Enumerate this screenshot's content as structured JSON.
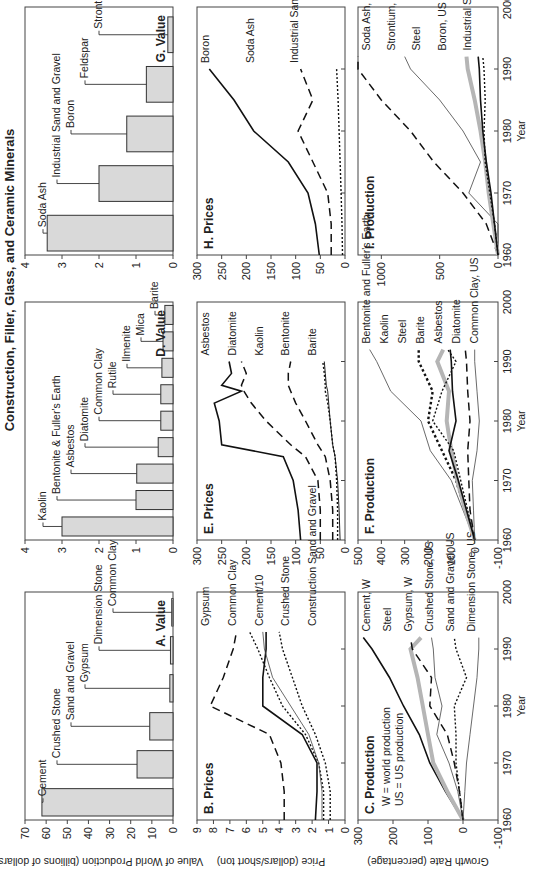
{
  "figure_title": "Construction, Filler, Glass, and Ceramic Minerals",
  "chart_data": [
    {
      "id": "A",
      "type": "bar",
      "title": "A. Value",
      "ylabel": "Value of World Production (billions of dollars)",
      "ylim": [
        0,
        70
      ],
      "yticks": [
        0,
        10,
        20,
        30,
        40,
        50,
        60,
        70
      ],
      "categories": [
        "Cement",
        "Crushed Stone",
        "Sand and Gravel",
        "Gypsum",
        "Dimension Stone",
        "Common Clay"
      ],
      "values": [
        62,
        17,
        11,
        1.5,
        1.2,
        0.6
      ]
    },
    {
      "id": "D",
      "type": "bar",
      "title": "D. Value",
      "ylim": [
        0,
        4
      ],
      "yticks": [
        0,
        1,
        2,
        3,
        4
      ],
      "categories": [
        "Kaolin",
        "Bentonite & Fuller's Earth",
        "Asbestos",
        "Diatomite",
        "Common Clay",
        "Rutile",
        "Ilmenite",
        "Mica",
        "Barite"
      ],
      "values": [
        3.0,
        1.0,
        0.98,
        0.4,
        0.33,
        0.33,
        0.3,
        0.27,
        0.22
      ]
    },
    {
      "id": "G",
      "type": "bar",
      "title": "G. Value",
      "ylim": [
        0,
        4
      ],
      "yticks": [
        0,
        1,
        2,
        3,
        4
      ],
      "categories": [
        "Soda Ash",
        "Industrial Sand and Gravel",
        "Boron",
        "Feldspar",
        "Strontium"
      ],
      "values": [
        3.4,
        2.0,
        1.25,
        0.72,
        0.14
      ]
    },
    {
      "id": "B",
      "type": "line",
      "title": "B. Prices",
      "ylabel": "Price (dollars/short ton)",
      "ylim": [
        0,
        9
      ],
      "yticks": [
        0,
        1,
        2,
        3,
        4,
        5,
        6,
        7,
        8,
        9
      ],
      "xlim": [
        1960,
        2000
      ],
      "x": [
        1960,
        1965,
        1970,
        1975,
        1980,
        1985,
        1990,
        1993
      ],
      "series": [
        {
          "name": "Gypsum",
          "style": "dashed",
          "values": [
            3.7,
            3.7,
            3.9,
            4.6,
            8.2,
            7.4,
            6.8,
            6.6
          ]
        },
        {
          "name": "Common Clay",
          "style": "dotted",
          "values": [
            1.3,
            1.3,
            1.6,
            2.4,
            3.8,
            4.6,
            5.3,
            5.8
          ]
        },
        {
          "name": "Cement/10",
          "style": "solid",
          "values": [
            1.8,
            1.7,
            1.7,
            2.6,
            5.0,
            5.0,
            4.8,
            4.8
          ]
        },
        {
          "name": "Crushed Stone",
          "style": "thin",
          "values": [
            1.4,
            1.4,
            1.6,
            2.2,
            3.3,
            4.4,
            4.9,
            5.0
          ]
        },
        {
          "name": "Construction Sand and Gravel",
          "style": "dotted",
          "values": [
            0.9,
            0.9,
            1.2,
            1.8,
            2.6,
            3.2,
            3.8,
            4.0
          ]
        }
      ]
    },
    {
      "id": "E",
      "type": "line",
      "title": "E. Prices",
      "ylim": [
        0,
        300
      ],
      "yticks": [
        0,
        50,
        100,
        150,
        200,
        250,
        300
      ],
      "xlim": [
        1960,
        2000
      ],
      "x": [
        1960,
        1965,
        1970,
        1974,
        1976,
        1980,
        1983,
        1985,
        1986,
        1988,
        1990
      ],
      "series": [
        {
          "name": "Asbestos",
          "style": "solid",
          "values": [
            90,
            95,
            105,
            125,
            250,
            255,
            265,
            210,
            250,
            230,
            235
          ]
        },
        {
          "name": "Diatomite",
          "style": "dashed",
          "values": [
            50,
            50,
            55,
            80,
            110,
            160,
            190,
            205,
            210,
            200,
            210
          ]
        },
        {
          "name": "Kaolin",
          "style": "dashed",
          "values": [
            25,
            25,
            30,
            40,
            55,
            80,
            100,
            110,
            115,
            115,
            110
          ]
        },
        {
          "name": "Bentonite",
          "style": "solid-thin",
          "values": [
            10,
            12,
            15,
            20,
            25,
            30,
            33,
            35,
            38,
            40,
            42
          ]
        },
        {
          "name": "Barite",
          "style": "dotted",
          "values": [
            15,
            15,
            17,
            20,
            25,
            30,
            35,
            40,
            40,
            42,
            45
          ]
        }
      ]
    },
    {
      "id": "H",
      "type": "line",
      "title": "H. Prices",
      "ylim": [
        0,
        300
      ],
      "yticks": [
        0,
        50,
        100,
        150,
        200,
        250,
        300
      ],
      "xlim": [
        1960,
        2000
      ],
      "x": [
        1960,
        1965,
        1970,
        1975,
        1980,
        1985,
        1990
      ],
      "series": [
        {
          "name": "Boron",
          "style": "solid",
          "values": [
            52,
            60,
            75,
            115,
            185,
            225,
            275
          ]
        },
        {
          "name": "Soda Ash",
          "style": "dashed",
          "values": [
            28,
            28,
            35,
            65,
            95,
            65,
            90
          ]
        },
        {
          "name": "Industrial Sand and Gravel",
          "style": "dotted",
          "values": [
            5,
            6,
            8,
            10,
            12,
            14,
            17
          ]
        }
      ]
    },
    {
      "id": "C",
      "type": "line",
      "title": "C. Production",
      "notes": [
        "W = world production",
        "US = US production"
      ],
      "xlabel": "Year",
      "ylabel": "Growth Rate (percentage)",
      "ylim": [
        -100,
        300
      ],
      "yticks": [
        -100,
        0,
        100,
        200,
        300
      ],
      "xlim": [
        1960,
        2000
      ],
      "xticks": [
        1960,
        1970,
        1980,
        1990,
        2000
      ],
      "x": [
        1960,
        1965,
        1970,
        1975,
        1980,
        1985,
        1990,
        1992
      ],
      "series": [
        {
          "name": "Cement, W",
          "style": "solid",
          "values": [
            0,
            50,
            95,
            125,
            170,
            210,
            260,
            285
          ]
        },
        {
          "name": "Steel",
          "style": "gray-thick",
          "values": [
            0,
            45,
            85,
            100,
            115,
            130,
            150,
            120
          ]
        },
        {
          "name": "Gypsum, W",
          "style": "dashed",
          "values": [
            0,
            10,
            25,
            45,
            95,
            90,
            145,
            150
          ]
        },
        {
          "name": "Crushed Stone, US",
          "style": "thin",
          "values": [
            0,
            15,
            40,
            75,
            60,
            80,
            85,
            90
          ]
        },
        {
          "name": "Sand and Gravel, US",
          "style": "dotted",
          "values": [
            0,
            10,
            20,
            20,
            25,
            -10,
            20,
            25
          ]
        },
        {
          "name": "Dimension Stone, US",
          "style": "thin",
          "values": [
            0,
            -5,
            -10,
            -20,
            -30,
            -40,
            -45,
            -45
          ]
        }
      ]
    },
    {
      "id": "F",
      "type": "line",
      "title": "F. Production",
      "xlabel": "Year",
      "ylim": [
        -100,
        500
      ],
      "yticks": [
        -100,
        0,
        100,
        200,
        300,
        400,
        500
      ],
      "xlim": [
        1960,
        2000
      ],
      "xticks": [
        1960,
        1970,
        1980,
        1990,
        2000
      ],
      "x": [
        1960,
        1965,
        1970,
        1975,
        1980,
        1985,
        1990,
        1992
      ],
      "series": [
        {
          "name": "Bentonite and Fuller's Earth",
          "style": "thin",
          "values": [
            0,
            50,
            100,
            190,
            230,
            360,
            420,
            450
          ]
        },
        {
          "name": "Kaolin",
          "style": "dotted-bold",
          "values": [
            0,
            40,
            80,
            140,
            200,
            180,
            240,
            240
          ]
        },
        {
          "name": "Steel",
          "style": "gray-thick",
          "values": [
            0,
            40,
            75,
            100,
            120,
            110,
            160,
            135
          ]
        },
        {
          "name": "Barite",
          "style": "dotted",
          "values": [
            0,
            30,
            60,
            90,
            180,
            140,
            80,
            115
          ]
        },
        {
          "name": "Asbestos",
          "style": "solid",
          "values": [
            0,
            35,
            70,
            110,
            80,
            95,
            100,
            105
          ]
        },
        {
          "name": "Diatomite",
          "style": "dashed",
          "values": [
            0,
            20,
            25,
            30,
            20,
            30,
            35,
            40
          ]
        },
        {
          "name": "Common Clay, US",
          "style": "thin",
          "values": [
            0,
            5,
            10,
            -10,
            -20,
            -10,
            0,
            0
          ]
        }
      ]
    },
    {
      "id": "I",
      "type": "line",
      "title": "I. Production",
      "xlabel": "Year",
      "ylim": [
        0,
        1200
      ],
      "yticks": [
        0,
        500,
        1000
      ],
      "xlim": [
        1960,
        2000
      ],
      "xticks": [
        1960,
        1970,
        1980,
        1990,
        2000
      ],
      "x": [
        1960,
        1965,
        1970,
        1975,
        1980,
        1985,
        1990,
        1992
      ],
      "series": [
        {
          "name": "Soda Ash, W",
          "style": "dashed",
          "values": [
            0,
            100,
            300,
            550,
            750,
            1000,
            1200,
            1250
          ]
        },
        {
          "name": "Strontium, W",
          "style": "thin",
          "values": [
            0,
            -50,
            250,
            150,
            300,
            500,
            750,
            800
          ]
        },
        {
          "name": "Steel",
          "style": "gray-thick",
          "values": [
            0,
            40,
            80,
            110,
            150,
            200,
            260,
            270
          ]
        },
        {
          "name": "Boron, US",
          "style": "solid",
          "values": [
            0,
            30,
            60,
            100,
            130,
            150,
            160,
            170
          ]
        },
        {
          "name": "Industrial Sand and Gravel, US",
          "style": "dotted",
          "values": [
            0,
            30,
            70,
            110,
            120,
            110,
            120,
            130
          ]
        }
      ]
    }
  ]
}
